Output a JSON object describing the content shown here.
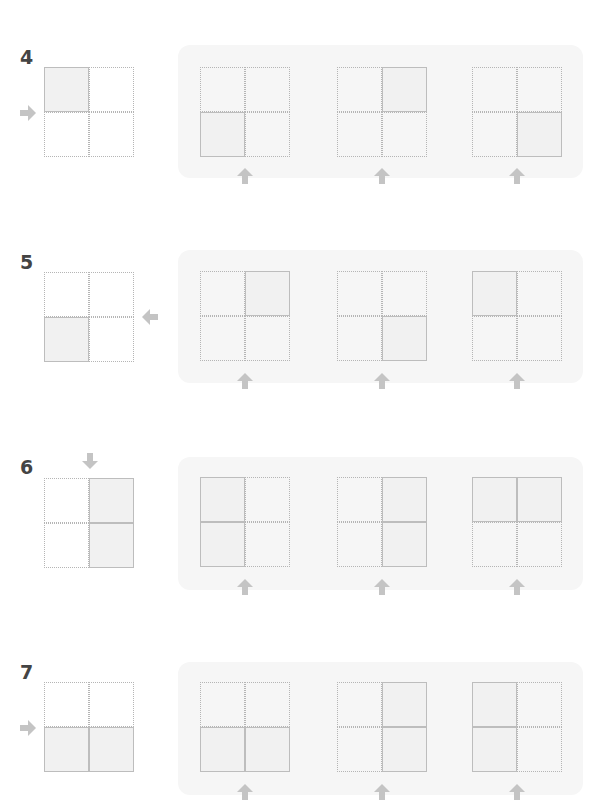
{
  "colors": {
    "arrow": "#c4c4c4",
    "panel": "#f6f6f6",
    "grid_line": "#b5b5b5",
    "shade": "#f1f1f1",
    "number": "#444444"
  },
  "rows": [
    {
      "number": "4",
      "prompt": {
        "shaded": [
          "tl"
        ],
        "arrow": "right"
      },
      "options": [
        {
          "shaded": [
            "bl"
          ]
        },
        {
          "shaded": [
            "tr"
          ]
        },
        {
          "shaded": [
            "br"
          ]
        }
      ]
    },
    {
      "number": "5",
      "prompt": {
        "shaded": [
          "bl"
        ],
        "arrow": "left"
      },
      "options": [
        {
          "shaded": [
            "tr"
          ]
        },
        {
          "shaded": [
            "br"
          ]
        },
        {
          "shaded": [
            "tl"
          ]
        }
      ]
    },
    {
      "number": "6",
      "prompt": {
        "shaded": [
          "tr",
          "br"
        ],
        "arrow": "down"
      },
      "options": [
        {
          "shaded": [
            "tl",
            "bl"
          ]
        },
        {
          "shaded": [
            "tr",
            "br"
          ]
        },
        {
          "shaded": [
            "tl",
            "tr"
          ]
        }
      ]
    },
    {
      "number": "7",
      "prompt": {
        "shaded": [
          "bl",
          "br"
        ],
        "arrow": "right"
      },
      "options": [
        {
          "shaded": [
            "bl",
            "br"
          ]
        },
        {
          "shaded": [
            "tr",
            "br"
          ]
        },
        {
          "shaded": [
            "tl",
            "bl"
          ]
        }
      ]
    }
  ]
}
